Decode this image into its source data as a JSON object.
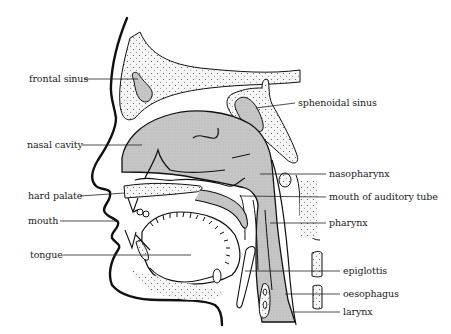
{
  "diagram": {
    "type": "anatomical-sagittal-section",
    "colors": {
      "outline": "#111111",
      "cavity_fill": "#c8c8c8",
      "bone_fill": "#f2f2f2",
      "background": "#ffffff"
    },
    "labels_left": [
      {
        "id": "frontal-sinus",
        "text": "frontal sinus"
      },
      {
        "id": "nasal-cavity",
        "text": "nasal cavity"
      },
      {
        "id": "hard-palate",
        "text": "hard palate"
      },
      {
        "id": "mouth",
        "text": "mouth"
      },
      {
        "id": "tongue",
        "text": "tongue"
      }
    ],
    "labels_right": [
      {
        "id": "sphenoidal-sinus",
        "text": "sphenoidal sinus"
      },
      {
        "id": "nasopharynx",
        "text": "nasopharynx"
      },
      {
        "id": "mouth-of-auditory-tube",
        "text": "mouth of auditory tube"
      },
      {
        "id": "pharynx",
        "text": "pharynx"
      },
      {
        "id": "epiglottis",
        "text": "epiglottis"
      },
      {
        "id": "oesophagus",
        "text": "oesophagus"
      },
      {
        "id": "larynx",
        "text": "larynx"
      }
    ]
  }
}
